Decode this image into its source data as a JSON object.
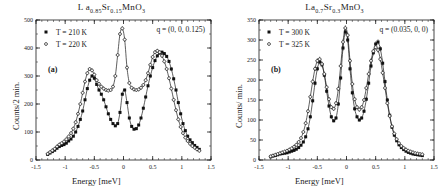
{
  "figure": {
    "panels": [
      {
        "id": "a",
        "label": "(a)",
        "title_main": "L a",
        "title_sub1": "0.85",
        "title_mid": "Sr",
        "title_sub2": "0.15",
        "title_end": "MnO",
        "title_sub3": "3",
        "title_plain": "La0.85Sr0.15MnO3",
        "q_annotation": "q = (0, 0, 0.125)",
        "ylabel": "Counts/2 min.",
        "xlabel": "Energy [meV]",
        "legend": [
          {
            "label": "T = 210 K",
            "marker": "filled-square"
          },
          {
            "label": "T = 220 K",
            "marker": "open-cross"
          }
        ]
      },
      {
        "id": "b",
        "label": "(b)",
        "title_main": "La",
        "title_sub1": "0.7",
        "title_mid": "Sr",
        "title_sub2": "0.3",
        "title_end": "MnO",
        "title_sub3": "3",
        "title_plain": "La0.7Sr0.3MnO3",
        "q_annotation": "q = (0.035, 0, 0)",
        "ylabel": "Counts/ min.",
        "xlabel": "Energy [meV]",
        "legend": [
          {
            "label": "T = 300 K",
            "marker": "filled-square"
          },
          {
            "label": "T = 325 K",
            "marker": "open-cross"
          }
        ]
      }
    ]
  },
  "chart_data": [
    {
      "type": "scatter",
      "panel": "a",
      "title": "La0.85Sr0.15MnO3",
      "xlabel": "Energy [meV]",
      "ylabel": "Counts/2 min.",
      "xlim": [
        -1.5,
        1.5
      ],
      "ylim": [
        0,
        500
      ],
      "xticks": [
        -1.5,
        -1,
        -0.5,
        0,
        0.5,
        1,
        1.5
      ],
      "xticklabels": [
        "-1.5",
        "-1",
        "-0.5",
        "0",
        "0.5",
        "1",
        "1.5"
      ],
      "yticks": [
        0,
        100,
        200,
        300,
        400,
        500
      ],
      "yticklabels": [
        "0",
        "100",
        "200",
        "300",
        "400",
        "500"
      ],
      "grid": false,
      "legend_position": "top-left",
      "annotations": [
        "(a)",
        "q = (0, 0, 0.125)"
      ],
      "series": [
        {
          "name": "T = 210 K",
          "marker": "filled-square",
          "x": [
            -1.3,
            -1.26,
            -1.22,
            -1.18,
            -1.14,
            -1.1,
            -1.06,
            -1.02,
            -0.98,
            -0.94,
            -0.9,
            -0.86,
            -0.82,
            -0.78,
            -0.74,
            -0.7,
            -0.66,
            -0.62,
            -0.58,
            -0.54,
            -0.5,
            -0.46,
            -0.42,
            -0.38,
            -0.34,
            -0.3,
            -0.26,
            -0.22,
            -0.18,
            -0.14,
            -0.1,
            -0.06,
            -0.02,
            0.02,
            0.06,
            0.1,
            0.14,
            0.18,
            0.22,
            0.26,
            0.3,
            0.34,
            0.38,
            0.42,
            0.46,
            0.5,
            0.54,
            0.58,
            0.62,
            0.66,
            0.7,
            0.74,
            0.78,
            0.82,
            0.86,
            0.9,
            0.94,
            0.98,
            1.02,
            1.06,
            1.1,
            1.14,
            1.18,
            1.22,
            1.26,
            1.3
          ],
          "y": [
            20,
            25,
            30,
            35,
            42,
            48,
            52,
            55,
            60,
            68,
            75,
            85,
            100,
            120,
            145,
            175,
            215,
            255,
            285,
            300,
            292,
            270,
            250,
            235,
            215,
            190,
            165,
            145,
            130,
            122,
            130,
            170,
            235,
            250,
            205,
            150,
            120,
            110,
            112,
            125,
            150,
            185,
            225,
            265,
            300,
            330,
            355,
            372,
            382,
            385,
            380,
            370,
            352,
            325,
            290,
            250,
            205,
            165,
            130,
            105,
            85,
            72,
            62,
            52,
            45,
            38
          ]
        },
        {
          "name": "T = 220 K",
          "marker": "open-cross",
          "x": [
            -1.3,
            -1.26,
            -1.22,
            -1.18,
            -1.14,
            -1.1,
            -1.06,
            -1.02,
            -0.98,
            -0.94,
            -0.9,
            -0.86,
            -0.82,
            -0.78,
            -0.74,
            -0.7,
            -0.66,
            -0.62,
            -0.58,
            -0.54,
            -0.5,
            -0.46,
            -0.42,
            -0.38,
            -0.34,
            -0.3,
            -0.26,
            -0.22,
            -0.18,
            -0.14,
            -0.1,
            -0.06,
            -0.02,
            0.02,
            0.06,
            0.1,
            0.14,
            0.18,
            0.22,
            0.26,
            0.3,
            0.34,
            0.38,
            0.42,
            0.46,
            0.5,
            0.54,
            0.58,
            0.62,
            0.66,
            0.7,
            0.74,
            0.78,
            0.82,
            0.86,
            0.9,
            0.94,
            0.98,
            1.02,
            1.06,
            1.1,
            1.14,
            1.18,
            1.22,
            1.26,
            1.3
          ],
          "y": [
            22,
            28,
            34,
            40,
            48,
            55,
            60,
            66,
            74,
            84,
            96,
            112,
            135,
            165,
            200,
            240,
            280,
            310,
            325,
            320,
            305,
            285,
            272,
            262,
            255,
            250,
            248,
            250,
            262,
            300,
            375,
            450,
            470,
            430,
            330,
            275,
            258,
            252,
            250,
            252,
            258,
            268,
            285,
            310,
            340,
            368,
            385,
            390,
            385,
            372,
            352,
            325,
            292,
            255,
            215,
            178,
            145,
            118,
            96,
            80,
            68,
            58,
            50,
            44,
            38,
            33
          ]
        }
      ]
    },
    {
      "type": "scatter",
      "panel": "b",
      "title": "La0.7Sr0.3MnO3",
      "xlabel": "Energy [meV]",
      "ylabel": "Counts/ min.",
      "xlim": [
        -1.5,
        1.5
      ],
      "ylim": [
        0,
        350
      ],
      "xticks": [
        -1.5,
        -1,
        -0.5,
        0,
        0.5,
        1,
        1.5
      ],
      "xticklabels": [
        "-1.5",
        "-1",
        "-0.5",
        "0",
        "0.5",
        "1",
        "1.5"
      ],
      "yticks": [
        0,
        50,
        100,
        150,
        200,
        250,
        300,
        350
      ],
      "yticklabels": [
        "0",
        "50",
        "100",
        "150",
        "200",
        "250",
        "300",
        "350"
      ],
      "grid": false,
      "legend_position": "top-left",
      "annotations": [
        "(b)",
        "q = (0.035, 0, 0)"
      ],
      "series": [
        {
          "name": "T = 300 K",
          "marker": "filled-square",
          "x": [
            -1.3,
            -1.26,
            -1.22,
            -1.18,
            -1.14,
            -1.1,
            -1.06,
            -1.02,
            -0.98,
            -0.94,
            -0.9,
            -0.86,
            -0.82,
            -0.78,
            -0.74,
            -0.7,
            -0.66,
            -0.62,
            -0.58,
            -0.54,
            -0.5,
            -0.46,
            -0.42,
            -0.38,
            -0.34,
            -0.3,
            -0.26,
            -0.22,
            -0.18,
            -0.14,
            -0.1,
            -0.06,
            -0.02,
            0.02,
            0.06,
            0.1,
            0.14,
            0.18,
            0.22,
            0.26,
            0.3,
            0.34,
            0.38,
            0.42,
            0.46,
            0.5,
            0.54,
            0.58,
            0.62,
            0.66,
            0.7,
            0.74,
            0.78,
            0.82,
            0.86,
            0.9,
            0.94,
            0.98,
            1.02,
            1.06,
            1.1,
            1.14,
            1.18,
            1.22,
            1.26,
            1.3
          ],
          "y": [
            8,
            10,
            11,
            13,
            15,
            16,
            17,
            18,
            20,
            22,
            24,
            27,
            31,
            37,
            45,
            58,
            78,
            108,
            148,
            192,
            228,
            245,
            238,
            212,
            172,
            135,
            108,
            98,
            105,
            140,
            205,
            280,
            320,
            300,
            228,
            168,
            128,
            108,
            100,
            105,
            122,
            152,
            192,
            235,
            268,
            290,
            295,
            278,
            242,
            196,
            150,
            112,
            82,
            62,
            48,
            38,
            31,
            26,
            22,
            19,
            17,
            15,
            14,
            13,
            12,
            11
          ]
        },
        {
          "name": "T = 325 K",
          "marker": "open-cross",
          "x": [
            -1.3,
            -1.26,
            -1.22,
            -1.18,
            -1.14,
            -1.1,
            -1.06,
            -1.02,
            -0.98,
            -0.94,
            -0.9,
            -0.86,
            -0.82,
            -0.78,
            -0.74,
            -0.7,
            -0.66,
            -0.62,
            -0.58,
            -0.54,
            -0.5,
            -0.46,
            -0.42,
            -0.38,
            -0.34,
            -0.3,
            -0.26,
            -0.22,
            -0.18,
            -0.14,
            -0.1,
            -0.06,
            -0.02,
            0.02,
            0.06,
            0.1,
            0.14,
            0.18,
            0.22,
            0.26,
            0.3,
            0.34,
            0.38,
            0.42,
            0.46,
            0.5,
            0.54,
            0.58,
            0.62,
            0.66,
            0.7,
            0.74,
            0.78,
            0.82,
            0.86,
            0.9,
            0.94,
            0.98,
            1.02,
            1.06,
            1.1,
            1.14,
            1.18,
            1.22,
            1.26,
            1.3
          ],
          "y": [
            9,
            11,
            13,
            15,
            17,
            19,
            21,
            23,
            26,
            29,
            33,
            38,
            45,
            55,
            70,
            92,
            122,
            158,
            196,
            228,
            248,
            252,
            240,
            215,
            182,
            152,
            132,
            128,
            142,
            178,
            235,
            295,
            330,
            312,
            248,
            190,
            152,
            132,
            126,
            132,
            150,
            180,
            215,
            248,
            272,
            282,
            275,
            252,
            218,
            180,
            142,
            110,
            84,
            66,
            52,
            42,
            35,
            30,
            26,
            23,
            21,
            19,
            17,
            16,
            15,
            14
          ]
        }
      ]
    }
  ]
}
